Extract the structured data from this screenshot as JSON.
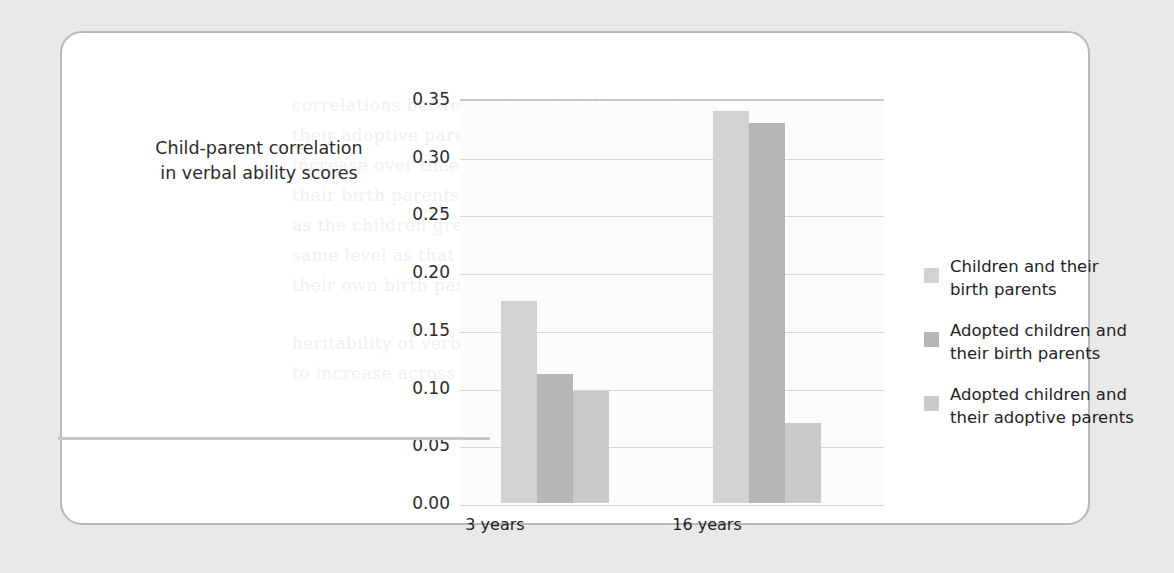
{
  "figure": {
    "panel_background": "#ffffff",
    "panel_border_color": "#b9b9b9",
    "page_background": "#e9e9e9"
  },
  "axis_title": "Child-parent correlation\nin verbal ability scores",
  "axis_title_line1": "Child-parent correlation",
  "axis_title_line2": "in verbal ability scores",
  "ghost_lines": [
    "correlations between adopted children and",
    "their adoptive parents were low and did not",
    "increase over time. The correlations with",
    "their birth parents, however, rose steadily",
    "as the children grew older, reaching the",
    "same level as that of children raised by",
    "their own birth parents by age 16.",
    "heritability of verbal ability appears",
    "to increase across development."
  ],
  "legend": {
    "items": [
      {
        "label": "Children and their\nbirth parents",
        "color": "#d2d2d2"
      },
      {
        "label": "Adopted children and\ntheir birth parents",
        "color": "#b6b6b6"
      },
      {
        "label": "Adopted children and\ntheir adoptive parents",
        "color": "#cacaca"
      }
    ]
  },
  "chart_data": {
    "type": "bar",
    "title": "",
    "xlabel": "",
    "ylabel": "Child-parent correlation in verbal ability scores",
    "categories": [
      "3 years",
      "16 years"
    ],
    "series": [
      {
        "name": "Children and their birth parents",
        "color": "#d2d2d2",
        "values": [
          0.175,
          0.34
        ]
      },
      {
        "name": "Adopted children and their birth parents",
        "color": "#b6b6b6",
        "values": [
          0.112,
          0.329
        ]
      },
      {
        "name": "Adopted children and their adoptive parents",
        "color": "#cacaca",
        "values": [
          0.097,
          0.069
        ]
      }
    ],
    "ylim": [
      0.0,
      0.35
    ],
    "yticks": [
      "0.00",
      "0.05",
      "0.10",
      "0.15",
      "0.20",
      "0.25",
      "0.30",
      "0.35"
    ],
    "ytick_values": [
      0.0,
      0.05,
      0.1,
      0.15,
      0.2,
      0.25,
      0.3,
      0.35
    ],
    "grid": true,
    "legend_position": "right"
  }
}
